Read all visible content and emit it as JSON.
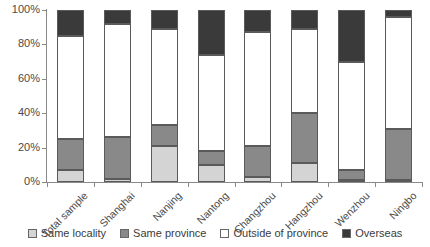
{
  "chart_data": {
    "type": "bar",
    "subtype": "stacked-100-percent",
    "title": "",
    "xlabel": "",
    "ylabel": "",
    "ylim": [
      0,
      100
    ],
    "y_unit": "%",
    "grid": false,
    "legend_position": "bottom",
    "categories": [
      "Total sample",
      "Shanghai",
      "Nanjing",
      "Nantong",
      "Changzhou",
      "Hangzhou",
      "Wenzhou",
      "Ningbo"
    ],
    "y_ticks": [
      "0%",
      "20%",
      "40%",
      "60%",
      "80%",
      "100%"
    ],
    "y_tick_values": [
      0,
      20,
      40,
      60,
      80,
      100
    ],
    "series": [
      {
        "name": "Same locality",
        "color": "#d4d4d4",
        "values": [
          7,
          2,
          21,
          10,
          3,
          11,
          1,
          1
        ]
      },
      {
        "name": "Same province",
        "color": "#898989",
        "values": [
          18,
          24,
          12,
          8,
          18,
          29,
          6,
          30
        ]
      },
      {
        "name": "Outside of province",
        "color": "#ffffff",
        "values": [
          60,
          66,
          56,
          56,
          66,
          49,
          63,
          65
        ]
      },
      {
        "name": "Overseas",
        "color": "#3a3a3a",
        "values": [
          15,
          8,
          11,
          26,
          13,
          11,
          30,
          4
        ]
      }
    ]
  },
  "legend": {
    "items": [
      {
        "label": "Same locality"
      },
      {
        "label": "Same province"
      },
      {
        "label": "Outside of province"
      },
      {
        "label": "Overseas"
      }
    ]
  }
}
